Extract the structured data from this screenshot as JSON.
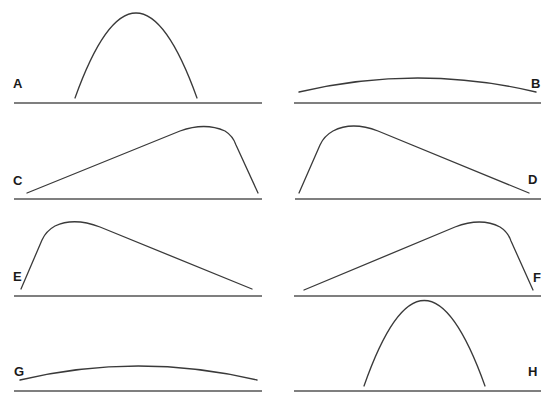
{
  "diagram": {
    "panels": [
      {
        "id": "A",
        "label": "A",
        "shape": "narrow tall symmetric arch"
      },
      {
        "id": "B",
        "label": "B",
        "shape": "wide low flat arch"
      },
      {
        "id": "C",
        "label": "C",
        "shape": "gradual rise, peak near right, steep drop"
      },
      {
        "id": "D",
        "label": "D",
        "shape": "steep rise, peak near left, gradual decline"
      },
      {
        "id": "E",
        "label": "E",
        "shape": "steep rise, peak near left, gradual decline"
      },
      {
        "id": "F",
        "label": "F",
        "shape": "gradual rise, peak near right, steep drop"
      },
      {
        "id": "G",
        "label": "G",
        "shape": "wide low flat arch"
      },
      {
        "id": "H",
        "label": "H",
        "shape": "narrow tall symmetric arch"
      }
    ]
  }
}
